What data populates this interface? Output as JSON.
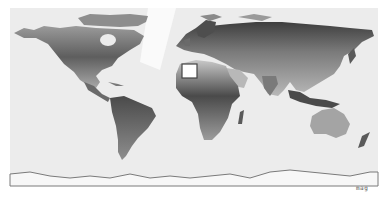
{
  "map": {
    "type": "world-shaded-relief",
    "projection": "equirectangular",
    "style": "grayscale",
    "credit_label": "MAG",
    "colors": {
      "background": "#ffffff",
      "ocean": "#ececec",
      "land_low": "#c9c9c9",
      "land_mid": "#8e8e8e",
      "land_high": "#3a3a3a",
      "ice_edge": "#7a7a7a",
      "highlight_box_fill": "#ffffff",
      "highlight_box_stroke": "#444444"
    },
    "highlight": {
      "label": "selected-region",
      "region": "Northwest Africa / Canary Islands",
      "box": {
        "x": 182,
        "y": 64,
        "width": 15,
        "height": 14
      }
    }
  }
}
